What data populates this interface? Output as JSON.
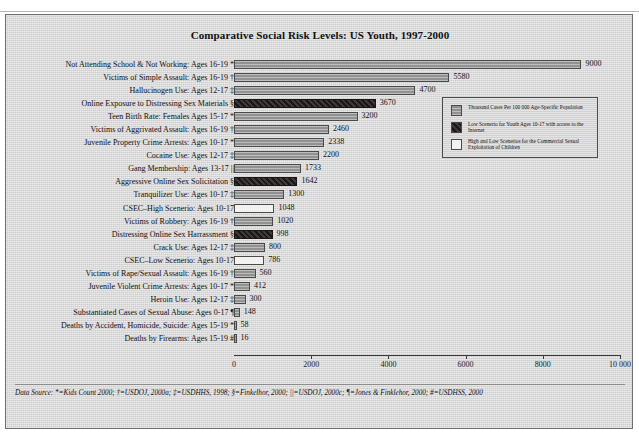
{
  "page_header": {
    "left_text": "",
    "right_text": ""
  },
  "figure": {
    "title": "Comparative Social Risk Levels: US Youth, 1997-2000",
    "data_source_note": "Data Source: *=Kids Count 2000; †=USDOJ, 2000a; ‡=USDHHS, 1998; §=Finkelhor, 2000; ||=USDOJ, 2000c; ¶=Jones & Finklehor, 2000; #=USDHSS, 2000"
  },
  "legend": {
    "items": [
      {
        "key": "gray",
        "label": "Thousand Cases Per 100 000 Age-Specific Population"
      },
      {
        "key": "dark",
        "label": "Low Scenerio for Youth Ages 10-17 with access to the Internet"
      },
      {
        "key": "white",
        "label": "High and Low Scenerios for the Commercial Sexual Exploitation of Children"
      }
    ]
  },
  "colors": {
    "gray_bar": "#9a9a9a",
    "dark_bar": "#241f1f",
    "white_bar": "#f2f2f0",
    "border": "#4a4a4a",
    "background": "#d9d9d9"
  },
  "chart_data": {
    "type": "bar",
    "orientation": "horizontal",
    "title": "Comparative Social Risk Levels: US Youth, 1997-2000",
    "xlabel": "",
    "ylabel": "",
    "xlim": [
      0,
      10000
    ],
    "grid": false,
    "legend_position": "upper-right-inside",
    "xticks": [
      0,
      2000,
      4000,
      6000,
      8000,
      10000
    ],
    "xtick_labels": [
      "0",
      "2000",
      "4000",
      "6000",
      "8000",
      "10 000"
    ],
    "categories": [
      "Not Attending School & Not Working: Ages 16-19 *",
      "Victims of Simple Assault: Ages 16-19 †",
      "Hallucinogen Use: Ages 12-17 ‡",
      "Online Exposure to Distressing Sex Materials §",
      "Teen Birth Rate: Females Ages 15-17 *",
      "Victims of Aggrivated Assault: Ages 16-19 †",
      "Juvenile Property Crime Arrests: Ages 10-17 *",
      "Cocaine Use: Ages 12-17 ‡",
      "Gang Membership: Ages 13-17 ||",
      "Aggressive Online Sex Solicitation §",
      "Tranquilizer Use: Ages 10-17 ‡",
      "CSEC–High Scenerio: Ages 10-17",
      "Victims of Robbery: Ages 16-19 †",
      "Distressing Online Sex Harrassment §",
      "Crack Use: Ages 12-17 ‡",
      "CSEC–Low Scenerio: Ages 10-17",
      "Victims of Rape/Sexual Assault: Ages 16-19 †",
      "Juvenile Violent Crime Arrests: Ages 10-17 *",
      "Heroin Use: Ages 12-17 ‡",
      "Substantiated Cases of Sexual Abuse: Ages 0-17 ¶",
      "Deaths by Accident, Homicide, Suicide: Ages 15-19 *",
      "Deaths by Firearms: Ages 15-19 #"
    ],
    "values": [
      9000,
      5580,
      4700,
      3670,
      3200,
      2460,
      2338,
      2200,
      1733,
      1642,
      1300,
      1048,
      1020,
      998,
      800,
      786,
      560,
      412,
      300,
      148,
      58,
      16
    ],
    "value_labels": [
      "9000",
      "5580",
      "4700",
      "3670",
      "3200",
      "2460",
      "2338",
      "2200",
      "1733",
      "1642",
      "1300",
      "1048",
      "1020",
      "998",
      "800",
      "786",
      "560",
      "412",
      "300",
      "148",
      "58",
      "16"
    ],
    "series_key": [
      "gray",
      "gray",
      "gray",
      "dark",
      "gray",
      "gray",
      "gray",
      "gray",
      "gray",
      "dark",
      "gray",
      "white",
      "gray",
      "dark",
      "gray",
      "white",
      "gray",
      "gray",
      "gray",
      "gray",
      "gray",
      "gray"
    ]
  }
}
